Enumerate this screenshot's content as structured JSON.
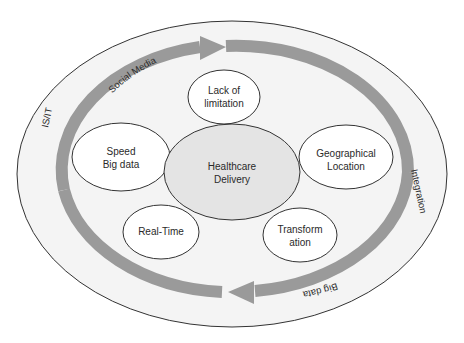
{
  "diagram": {
    "center_node": {
      "label_line1": "Healthcare",
      "label_line2": "Delivery",
      "fill": "#e4e4e4"
    },
    "nodes": [
      {
        "id": "lack-of-limitation",
        "line1": "Lack of",
        "line2": "limitation"
      },
      {
        "id": "speed-big-data",
        "line1": "Speed",
        "line2": "Big data"
      },
      {
        "id": "geographical-location",
        "line1": "Geographical",
        "line2": "Location"
      },
      {
        "id": "real-time",
        "line1": "Real-Time",
        "line2": ""
      },
      {
        "id": "transformation",
        "line1": "Transform",
        "line2": "ation"
      }
    ],
    "arrow_labels": {
      "top": "Social Media",
      "bottom": "Big data"
    },
    "outer_ring_labels": {
      "left": "IS/IT",
      "right": "Integration"
    },
    "colors": {
      "outer_fill": "#f4f4f4",
      "arrow": "#9a9a9a",
      "stroke": "#333333",
      "node_fill": "#ffffff"
    }
  }
}
